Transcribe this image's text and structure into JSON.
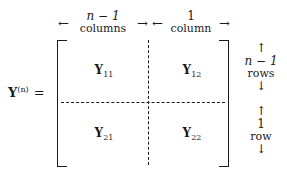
{
  "equation": {
    "lhs": {
      "symbol": "Y",
      "superscript": "(n)",
      "equals": "="
    },
    "blocks": [
      {
        "symbol": "Y",
        "subscript": "11",
        "position": "top-left"
      },
      {
        "symbol": "Y",
        "subscript": "12",
        "position": "top-right"
      },
      {
        "symbol": "Y",
        "subscript": "21",
        "position": "bottom-left"
      },
      {
        "symbol": "Y",
        "subscript": "22",
        "position": "bottom-right"
      }
    ],
    "column_labels": [
      {
        "count": "n − 1",
        "unit": "columns",
        "left_arrow": "←",
        "right_arrow": "→"
      },
      {
        "count": "1",
        "unit": "column",
        "left_arrow": "←",
        "right_arrow": "→"
      }
    ],
    "row_labels": [
      {
        "count": "n − 1",
        "unit": "rows",
        "up_arrow": "↑",
        "down_arrow": "↓"
      },
      {
        "count": "1",
        "unit": "row",
        "up_arrow": "↑",
        "down_arrow": "↓"
      }
    ],
    "colors": {
      "ink": "#1a1a1a",
      "background": "#ffffff"
    }
  }
}
